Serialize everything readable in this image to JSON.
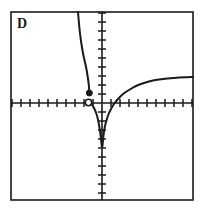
{
  "figure": {
    "panel_label": "D",
    "background_color": "#ffffff",
    "ink_color": "#1a1a1a",
    "frame": {
      "x": 11,
      "y": 12,
      "width": 182,
      "height": 188,
      "stroke_width": 1.6
    }
  },
  "chart_data": {
    "type": "line",
    "title": "D",
    "xlabel": "",
    "ylabel": "",
    "grid": false,
    "legend": null,
    "axes": {
      "origin_px": {
        "x": 102,
        "y": 103
      },
      "x_axis": {
        "y_px": 103,
        "x_start_px": 11,
        "x_end_px": 193,
        "tick_spacing_px": 9,
        "tick_half_length_px": 4,
        "ticks_left": 10,
        "ticks_right": 10
      },
      "y_axis": {
        "x_px": 102,
        "y_start_px": 12,
        "y_end_px": 200,
        "tick_spacing_px": 9,
        "tick_half_length_px": 4,
        "ticks_above": 10,
        "ticks_below": 10
      },
      "xlim": [
        -10,
        10
      ],
      "ylim": [
        -10,
        10
      ]
    },
    "series": [
      {
        "name": "left-branch",
        "description": "Decreasing concave curve entering from top of frame near x=-2.2, falling steeply then flattening to a closed endpoint just above the x-axis.",
        "closed_endpoint": true,
        "points_px": [
          [
            78,
            12
          ],
          [
            78.6,
            19
          ],
          [
            79.3,
            27
          ],
          [
            80.2,
            35
          ],
          [
            81.3,
            43
          ],
          [
            82.6,
            51
          ],
          [
            84.0,
            58
          ],
          [
            85.4,
            64
          ],
          [
            86.6,
            70
          ],
          [
            87.6,
            76
          ],
          [
            88.3,
            81
          ],
          [
            88.8,
            85
          ],
          [
            89.0,
            88
          ],
          [
            89.2,
            91
          ],
          [
            89.3,
            93
          ]
        ]
      },
      {
        "name": "asymptote-descent",
        "description": "Curve plunging to negative infinity along the y-axis from just right of the open circle.",
        "points_px": [
          [
            89.3,
            102
          ],
          [
            91.5,
            104
          ],
          [
            94.0,
            108
          ],
          [
            96.5,
            114
          ],
          [
            98.5,
            122
          ],
          [
            100.0,
            131
          ],
          [
            100.9,
            138
          ],
          [
            101.4,
            143
          ],
          [
            101.7,
            146
          ]
        ]
      },
      {
        "name": "right-branch",
        "description": "Increasing concave-down curve rising from the asymptote at x=0 toward the right edge of the frame.",
        "points_px": [
          [
            102.5,
            146
          ],
          [
            103.0,
            140
          ],
          [
            103.8,
            133
          ],
          [
            105.0,
            126
          ],
          [
            106.6,
            120
          ],
          [
            108.6,
            114
          ],
          [
            111.0,
            109
          ],
          [
            114.0,
            104
          ],
          [
            118.0,
            99
          ],
          [
            123.0,
            94
          ],
          [
            129.0,
            90
          ],
          [
            136.0,
            86
          ],
          [
            144.0,
            83
          ],
          [
            153.0,
            80.5
          ],
          [
            163.0,
            79
          ],
          [
            174.0,
            78
          ],
          [
            185.0,
            77.3
          ],
          [
            193.0,
            77
          ]
        ]
      }
    ],
    "markers": [
      {
        "name": "closed-dot",
        "style": "filled",
        "x_px": 89.3,
        "y_px": 93,
        "radius_px": 3.0
      },
      {
        "name": "open-dot",
        "style": "hollow",
        "x_px": 88.5,
        "y_px": 102.5,
        "radius_px": 3.2
      }
    ]
  }
}
